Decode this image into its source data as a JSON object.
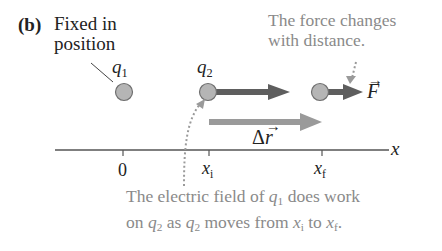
{
  "panel_label": "(b)",
  "fixed_label": {
    "line1": "Fixed in",
    "line2": "position"
  },
  "charges": {
    "q1": {
      "symbol": "q",
      "subscript": "1"
    },
    "q2": {
      "symbol": "q",
      "subscript": "2"
    }
  },
  "force_note": {
    "line1": "The force changes",
    "line2": "with distance."
  },
  "force_vector": {
    "symbol": "F"
  },
  "displacement_vector": {
    "prefix": "Δ",
    "symbol": "r"
  },
  "axis": {
    "label": "x",
    "ticks": [
      {
        "label": "0"
      },
      {
        "symbol": "x",
        "subscript": "i"
      },
      {
        "symbol": "x",
        "subscript": "f"
      }
    ]
  },
  "work_note": {
    "line1_a": "The electric field of ",
    "line1_q": "q",
    "line1_sub": "1",
    "line1_b": " does work",
    "line2_a": "on ",
    "line2_q1": "q",
    "line2_sub1": "2",
    "line2_b": " as ",
    "line2_q2": "q",
    "line2_sub2": "2",
    "line2_c": " moves from ",
    "line2_x1": "x",
    "line2_xs1": "i",
    "line2_d": " to ",
    "line2_x2": "x",
    "line2_xs2": "f",
    "line2_e": "."
  },
  "colors": {
    "charge_fill": "#b5b5b5",
    "charge_stroke": "#6f6f6f",
    "force_arrow": "#5e5e5e",
    "displacement_arrow": "#9a9a9a",
    "annotation_text": "#8a8a8a",
    "axis": "#555555"
  }
}
